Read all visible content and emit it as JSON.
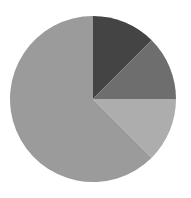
{
  "chart_data": {
    "type": "pie",
    "title": "",
    "labels": [
      "Slice A",
      "Slice B",
      "Slice C",
      "Slice D"
    ],
    "values": [
      12.5,
      12.5,
      12.5,
      62.5
    ],
    "colors": [
      "#444444",
      "#6e6e6e",
      "#adadad",
      "#9b9b9b"
    ],
    "start_angle_deg": 0,
    "direction": "clockwise",
    "legend": "none",
    "center": [
      93,
      99
    ],
    "radius": 83
  }
}
